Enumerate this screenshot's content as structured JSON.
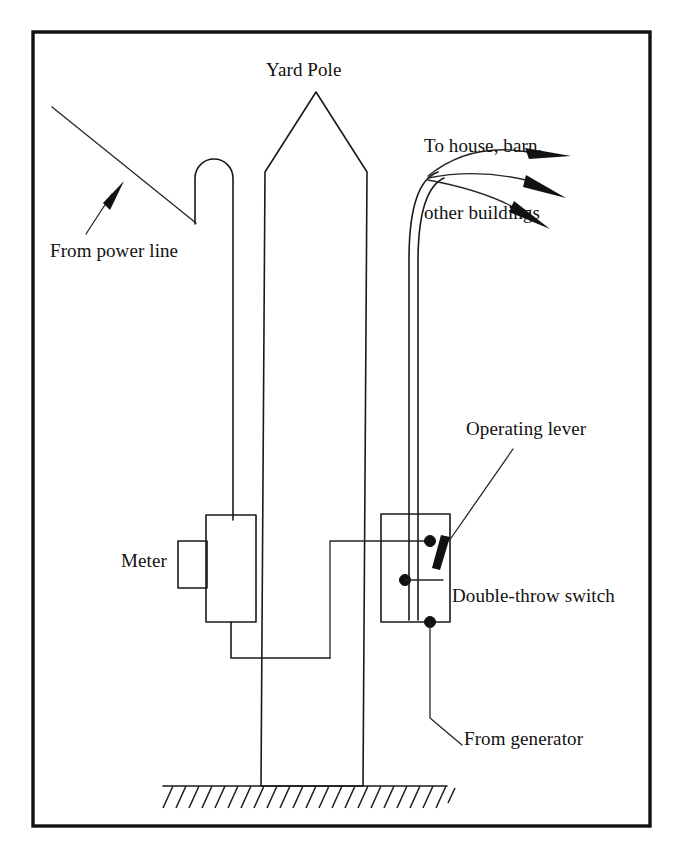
{
  "figure": {
    "kind": "technical-line-diagram",
    "background_color": "#ffffff",
    "ink_color": "#111111",
    "border": {
      "shown": true,
      "color": "#111111",
      "style": "rectangle"
    }
  },
  "labels": {
    "yard_pole": "Yard Pole",
    "to_house_line1": "To house, barn,",
    "to_house_line2": "other buildings",
    "from_power_line": "From power line",
    "operating_lever": "Operating lever",
    "meter": "Meter",
    "double_throw_switch": "Double-throw switch",
    "from_generator": "From generator"
  },
  "components": {
    "pole": {
      "name": "yard-pole",
      "shape": "tapered post with pointed top",
      "grounded": true
    },
    "weatherhead": {
      "name": "service-weatherhead",
      "shape": "inverted-U conduit"
    },
    "meter_box": {
      "name": "electric-meter",
      "shape": "rectangle with side nipple"
    },
    "switch_box": {
      "name": "double-throw-switch-box",
      "shape": "rectangle",
      "contacts": 3
    },
    "operating_lever": {
      "name": "operating-lever",
      "state": "upper position"
    },
    "service_drops": {
      "name": "service-conductors",
      "count": 3,
      "direction": "to the right"
    },
    "ground": {
      "name": "ground-hatching",
      "style": "hatched earth line"
    }
  },
  "arrows": {
    "from_power_line": {
      "points": "up-right",
      "count": 1
    },
    "to_buildings": {
      "points": "right and down-right",
      "count": 3
    }
  }
}
